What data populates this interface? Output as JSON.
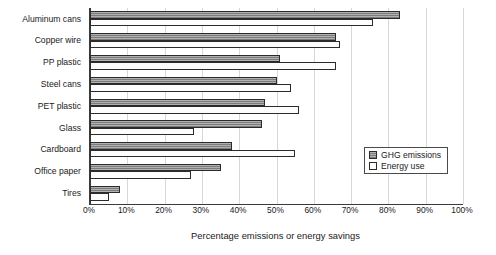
{
  "chart_data": {
    "type": "bar",
    "orientation": "horizontal",
    "title": "",
    "xlabel": "Percentage emissions or energy savings",
    "ylabel": "",
    "xlim": [
      0,
      100
    ],
    "xticks": [
      "0%",
      "10%",
      "20%",
      "30%",
      "40%",
      "50%",
      "60%",
      "70%",
      "80%",
      "90%",
      "100%"
    ],
    "xtick_values": [
      0,
      10,
      20,
      30,
      40,
      50,
      60,
      70,
      80,
      90,
      100
    ],
    "grid": true,
    "legend_position": "middle-right",
    "categories": [
      "Aluminum cans",
      "Copper wire",
      "PP plastic",
      "Steel cans",
      "PET plastic",
      "Glass",
      "Cardboard",
      "Office paper",
      "Tires"
    ],
    "series": [
      {
        "name": "GHG emissions",
        "color": "#8a8a8a",
        "values": [
          83,
          66,
          51,
          50,
          47,
          46,
          38,
          35,
          8
        ]
      },
      {
        "name": "Energy use",
        "color": "#ffffff",
        "values": [
          76,
          67,
          66,
          54,
          56,
          28,
          55,
          27,
          5
        ]
      }
    ]
  },
  "legend": {
    "items": [
      {
        "label": "GHG emissions",
        "swatch": "ghg"
      },
      {
        "label": "Energy use",
        "swatch": "energy"
      }
    ]
  }
}
